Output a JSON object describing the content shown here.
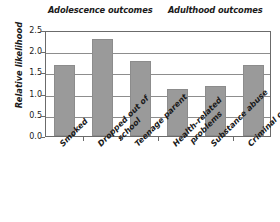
{
  "chart_data": {
    "type": "bar",
    "title": "",
    "xlabel": "",
    "ylabel": "Relative likelihood",
    "ylim": [
      0.0,
      2.5
    ],
    "grid": true,
    "legend": "none",
    "categories": [
      "Smoked",
      "Dropped out of school",
      "Teenage parent",
      "Health-related problems",
      "Substance abuse",
      "Criminal conviction"
    ],
    "values": [
      1.68,
      2.28,
      1.78,
      1.1,
      1.17,
      1.68
    ],
    "ytick_labels": [
      "2.5",
      "2.0",
      "1.5",
      "1.0",
      "0.5",
      "0.0"
    ],
    "ytick_values": [
      2.5,
      2.0,
      1.5,
      1.0,
      0.5,
      0.0
    ],
    "groups": [
      {
        "label": "Adolescence outcomes",
        "categories": [
          "Smoked",
          "Dropped out of school",
          "Teenage parent"
        ]
      },
      {
        "label": "Adulthood outcomes",
        "categories": [
          "Health-related problems",
          "Substance abuse",
          "Criminal conviction"
        ]
      }
    ],
    "bar_color": "#9a9a9a",
    "axis_color": "#6b6b6b"
  },
  "headers": {
    "adolescence": "Adolescence outcomes",
    "adulthood": "Adulthood outcomes"
  },
  "axis": {
    "y_title": "Relative likelihood",
    "ticks": [
      "2.5",
      "2.0",
      "1.5",
      "1.0",
      "0.5",
      "0.0"
    ]
  },
  "categories": {
    "c0_line1": "Smoked",
    "c1_line1": "Dropped out of",
    "c1_line2": "school",
    "c2_line1": "Teenage parent",
    "c3_line1": "Health-related",
    "c3_line2": "problems",
    "c4_line1": "Substance abuse",
    "c5_line1": "Criminal conviction"
  }
}
